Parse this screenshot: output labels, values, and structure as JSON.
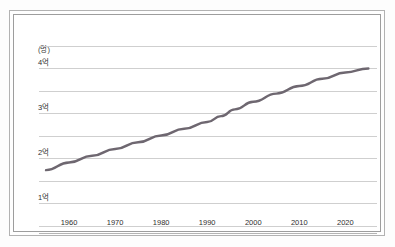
{
  "chart_data": {
    "type": "line",
    "title": "",
    "subtitle": "",
    "xlabel": "",
    "ylabel": "",
    "unit_label": "(명)",
    "xlim": [
      1955,
      2026
    ],
    "ylim": [
      0,
      4.5
    ],
    "y_unit_suffix": "억",
    "grid": true,
    "grid_orientation": "horizontal",
    "legend": "none",
    "x_tick_labels": [
      "1960",
      "1970",
      "1980",
      "1990",
      "2000",
      "2010",
      "2020"
    ],
    "x_tick_values": [
      1960,
      1970,
      1980,
      1990,
      2000,
      2010,
      2020
    ],
    "y_tick_labels": [
      "1억",
      "2억",
      "3억",
      "4억"
    ],
    "y_tick_values": [
      1,
      2,
      3,
      4
    ],
    "y_gridline_values": [
      0.5,
      1.0,
      1.5,
      2.0,
      2.5,
      3.0,
      3.5,
      4.0,
      4.5
    ],
    "series": [
      {
        "name": "인구",
        "color": "#6e6770",
        "x": [
          1955,
          1960,
          1965,
          1970,
          1975,
          1980,
          1985,
          1990,
          1993,
          1996,
          2000,
          2005,
          2010,
          2015,
          2020,
          2025
        ],
        "values": [
          1.73,
          1.9,
          2.05,
          2.2,
          2.35,
          2.5,
          2.65,
          2.8,
          2.93,
          3.08,
          3.25,
          3.43,
          3.6,
          3.76,
          3.9,
          3.99
        ]
      }
    ]
  },
  "figure": {
    "background_color": "#ffffff",
    "frame_color": "#9d9d9d",
    "grid_color": "#cfcfcf",
    "text_color": "#2e2e2e"
  }
}
